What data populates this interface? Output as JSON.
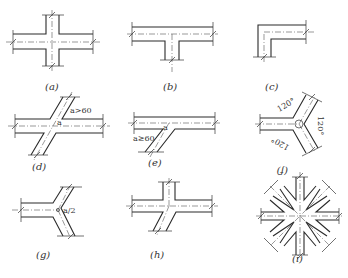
{
  "figure": {
    "panels": [
      {
        "id": "a",
        "label": "(a)",
        "type": "cross-junction"
      },
      {
        "id": "b",
        "label": "(b)",
        "type": "T-junction"
      },
      {
        "id": "c",
        "label": "(c)",
        "type": "L-corner"
      },
      {
        "id": "d",
        "label": "(d)",
        "type": "oblique-cross",
        "annotation": "a>60",
        "angle_mark": "a"
      },
      {
        "id": "e",
        "label": "(e)",
        "type": "oblique-T",
        "annotation": "a≥60",
        "angle_mark": "a"
      },
      {
        "id": "f",
        "label": "(f)",
        "type": "Y-junction-equal",
        "angles": [
          "120°",
          "120°",
          "120°"
        ]
      },
      {
        "id": "g",
        "label": "(g)",
        "type": "Y-junction",
        "annotation": "a/2"
      },
      {
        "id": "h",
        "label": "(h)",
        "type": "cross-with-oblique-leg"
      },
      {
        "id": "i",
        "label": "(i)",
        "type": "radial-8-way-junction"
      }
    ]
  },
  "colors": {
    "line": "#2a2a2a",
    "background": "#ffffff"
  }
}
